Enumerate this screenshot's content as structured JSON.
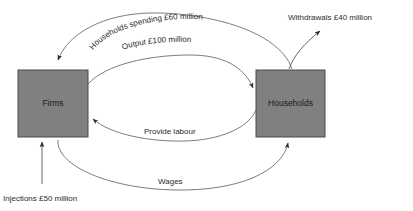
{
  "diagram": {
    "background_color": "#ffffff",
    "node_fill_color": "#808080",
    "node_stroke_color": "#4a4a4a",
    "edge_color": "#6e6e6e",
    "text_color": "#2b2b2b",
    "nodes": [
      {
        "id": "firms",
        "label": "Firms",
        "x": 18,
        "y": 70,
        "width": 70,
        "height": 67
      },
      {
        "id": "households",
        "label": "Households",
        "x": 256,
        "y": 70,
        "width": 69,
        "height": 67
      }
    ],
    "flows": [
      {
        "id": "households-spending",
        "label": "Households spending £60 million",
        "from": "households",
        "to": "firms",
        "value": "£60 million"
      },
      {
        "id": "output",
        "label": "Output £100 million",
        "from": "firms",
        "to": "households",
        "value": "£100 million"
      },
      {
        "id": "provide-labour",
        "label": "Provide labour",
        "from": "households",
        "to": "firms",
        "value": ""
      },
      {
        "id": "wages",
        "label": "Wages",
        "from": "firms",
        "to": "households",
        "value": ""
      },
      {
        "id": "withdrawals",
        "label": "Withdrawals £40 million",
        "from": "households",
        "to": "external",
        "value": "£40 million"
      },
      {
        "id": "injections",
        "label": "Injections £50 million",
        "from": "external",
        "to": "firms",
        "value": "£50 million"
      }
    ]
  }
}
